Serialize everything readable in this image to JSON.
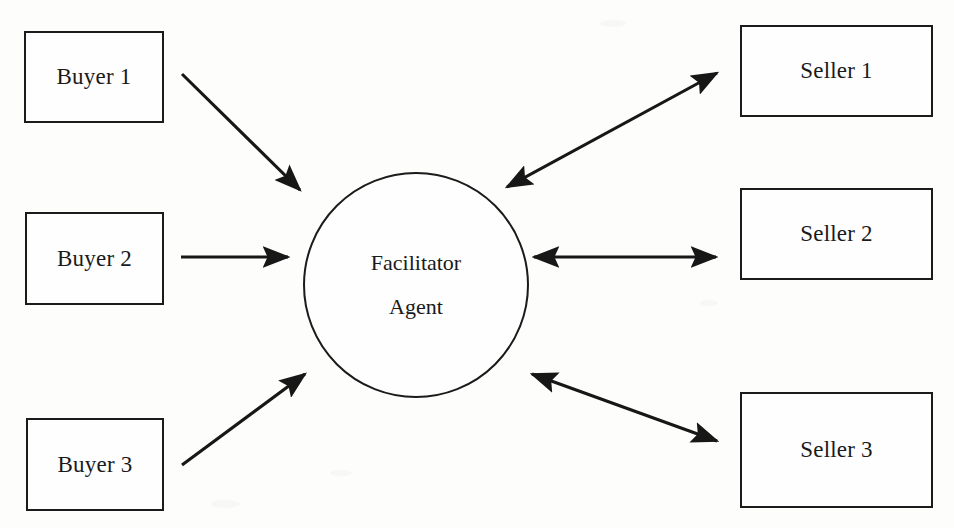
{
  "diagram": {
    "background_color": "#fdfdfc",
    "stroke_color": "#1b1b1b",
    "text_color": "#1a1a1a",
    "hub": {
      "shape": "circle",
      "line1": "Facilitator",
      "line2": "Agent"
    },
    "buyers": [
      {
        "label": "Buyer 1"
      },
      {
        "label": "Buyer 2"
      },
      {
        "label": "Buyer 3"
      }
    ],
    "sellers": [
      {
        "label": "Seller 1"
      },
      {
        "label": "Seller 2"
      },
      {
        "label": "Seller 3"
      }
    ],
    "edges": [
      {
        "name": "buyer-1-to-agent",
        "from": "Buyer 1",
        "to": "Facilitator Agent",
        "direction": "one-way"
      },
      {
        "name": "buyer-2-to-agent",
        "from": "Buyer 2",
        "to": "Facilitator Agent",
        "direction": "one-way"
      },
      {
        "name": "buyer-3-to-agent",
        "from": "Buyer 3",
        "to": "Facilitator Agent",
        "direction": "one-way"
      },
      {
        "name": "agent-to-seller-1",
        "from": "Facilitator Agent",
        "to": "Seller 1",
        "direction": "two-way"
      },
      {
        "name": "agent-to-seller-2",
        "from": "Facilitator Agent",
        "to": "Seller 2",
        "direction": "two-way"
      },
      {
        "name": "agent-to-seller-3",
        "from": "Facilitator Agent",
        "to": "Seller 3",
        "direction": "two-way"
      }
    ]
  }
}
